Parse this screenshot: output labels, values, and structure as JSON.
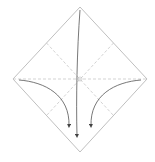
{
  "diagram": {
    "type": "origami-fold-step",
    "paper": {
      "shape": "square-diamond",
      "vertices": {
        "top": [
          80,
          7
        ],
        "right": [
          147,
          79
        ],
        "bottom": [
          80,
          152
        ],
        "left": [
          13,
          79
        ]
      },
      "edge_color": "#b8b8b8"
    },
    "creases": {
      "style": "valley-dashed",
      "color": "#c4c4c4",
      "lines": [
        "horizontal-diagonal",
        "upper-left-to-lower-right-midline",
        "upper-right-to-lower-left-midline"
      ]
    },
    "arrows": [
      {
        "name": "fold-top-corner-down",
        "from": "top",
        "to": [
          77,
          137
        ],
        "color": "#555555"
      },
      {
        "name": "fold-left-corner-in",
        "from": "left",
        "to": [
          70,
          127
        ],
        "color": "#555555"
      },
      {
        "name": "fold-right-corner-in",
        "from": "right",
        "to": [
          90,
          127
        ],
        "color": "#555555"
      }
    ]
  }
}
